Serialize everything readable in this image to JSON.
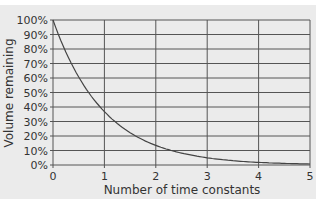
{
  "chart_data": {
    "type": "line",
    "title": "",
    "xlabel": "Number of time constants",
    "ylabel": "Volume remaining",
    "x_ticks": [
      "0",
      "1",
      "2",
      "3",
      "4",
      "5"
    ],
    "y_ticks": [
      "0%",
      "10%",
      "20%",
      "30%",
      "40%",
      "50%",
      "60%",
      "70%",
      "80%",
      "90%",
      "100%"
    ],
    "xlim": [
      0,
      5
    ],
    "ylim": [
      0,
      100
    ],
    "grid": true,
    "legend": null,
    "series": [
      {
        "name": "Volume remaining",
        "x": [
          0,
          0.5,
          1,
          1.5,
          2,
          2.5,
          3,
          3.5,
          4,
          4.5,
          5
        ],
        "y": [
          100,
          60.7,
          36.8,
          22.3,
          13.5,
          8.2,
          5.0,
          3.0,
          1.8,
          1.1,
          0.7
        ]
      }
    ],
    "colors": {
      "background": "#ebebeb",
      "grid": "#555555",
      "line": "#444444",
      "text": "#333333"
    }
  }
}
